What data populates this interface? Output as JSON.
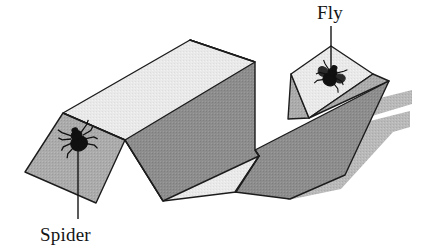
{
  "figure": {
    "background_color": "#ffffff",
    "labels": [
      {
        "id": "spider",
        "text": "Spider",
        "text_x": 40,
        "text_y": 241,
        "leader_from_x": 78,
        "leader_from_y": 219,
        "leader_to_x": 78,
        "leader_to_y": 150
      },
      {
        "id": "fly",
        "text": "Fly",
        "text_x": 318,
        "text_y": 19,
        "leader_from_x": 331,
        "leader_from_y": 26,
        "leader_to_x": 331,
        "leader_to_y": 69
      }
    ],
    "creatures": [
      {
        "id": "spider",
        "name": "spider-bug",
        "x": 78,
        "y": 140,
        "scale": 1.0,
        "rotation": -18,
        "color": "#101010"
      },
      {
        "id": "fly",
        "name": "fly-bug",
        "x": 331,
        "y": 76,
        "scale": 0.92,
        "rotation": 22,
        "color": "#101010"
      }
    ],
    "colors": {
      "panel_light": "#e9e9e9",
      "panel_mid": "#ababab",
      "panel_dark": "#8d8d8d",
      "panel_midlight": "#c9c9c9",
      "shadow": "#b9b9b9",
      "outline": "#1c1c1c",
      "label_text": "#151515"
    },
    "panels": [
      {
        "id": "shadow-cast",
        "name": "cast-shadow",
        "fill": "#b9b9b9",
        "stroke": "none",
        "points": "254,149 409,112 409,128 392,133 340,188 290,199"
      },
      {
        "id": "left-face-spider",
        "name": "spider-panel-left-slope",
        "fill": "#ababab",
        "stroke": "#1c1c1c",
        "points": "25,172 63,113 125,140 95,202"
      },
      {
        "id": "left-top-light",
        "name": "light-panel-left-top",
        "fill": "#e9e9e9",
        "stroke": "#1c1c1c",
        "points": "63,113 190,40 250,63 125,140"
      },
      {
        "id": "ridge-dark-main",
        "name": "dark-panel-main-ridge",
        "fill": "#8d8d8d",
        "stroke": "#1c1c1c",
        "points": "190,40 254,62 254,149 162,200 125,140"
      },
      {
        "id": "valley-light-lower",
        "name": "light-panel-valley-lower",
        "fill": "#e9e9e9",
        "stroke": "#1c1c1c",
        "points": "125,140 162,200 235,191 258,155"
      },
      {
        "id": "right-inner-dark",
        "name": "dark-panel-right-inner",
        "fill": "#8d8d8d",
        "stroke": "#1c1c1c",
        "points": "254,149 258,155 235,191 303,178 388,81 308,117"
      },
      {
        "id": "right-fold-mid",
        "name": "mid-panel-right-fold",
        "fill": "#ababab",
        "stroke": "#1c1c1c",
        "points": "288,118 308,117 388,81 372,74"
      },
      {
        "id": "fly-panel",
        "name": "fly-panel-light",
        "fill": "#e9e9e9",
        "stroke": "#1c1c1c",
        "points": "290,75 330,47 372,74 308,117"
      },
      {
        "id": "fly-panel-back-edge",
        "name": "fly-panel-back-sliver",
        "fill": "#c9c9c9",
        "stroke": "#1c1c1c",
        "points": "288,118 290,75 308,117"
      }
    ]
  }
}
